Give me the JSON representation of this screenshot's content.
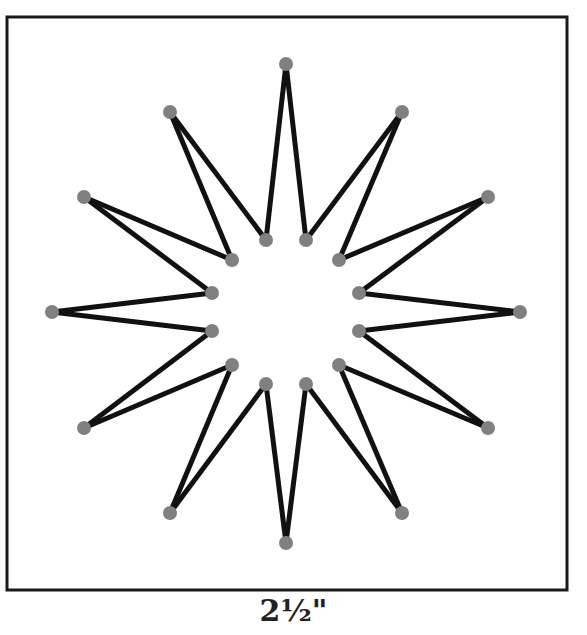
{
  "figure": {
    "caption": "2½\"",
    "frame": {
      "x": 7,
      "y": 17,
      "width": 560,
      "height": 573,
      "stroke": "#1a1a1a"
    },
    "line_color": "#111111",
    "dot_color": "#808080",
    "outer_points": [
      [
        286,
        64
      ],
      [
        402,
        112
      ],
      [
        488,
        197
      ],
      [
        520,
        312
      ],
      [
        488,
        428
      ],
      [
        402,
        513
      ],
      [
        286,
        543
      ],
      [
        170,
        513
      ],
      [
        84,
        428
      ],
      [
        52,
        312
      ],
      [
        84,
        197
      ],
      [
        170,
        112
      ]
    ],
    "inner_points": [
      [
        306,
        240
      ],
      [
        339,
        260
      ],
      [
        359,
        293
      ],
      [
        359,
        331
      ],
      [
        339,
        365
      ],
      [
        306,
        384
      ],
      [
        266,
        384
      ],
      [
        232,
        365
      ],
      [
        212,
        331
      ],
      [
        212,
        293
      ],
      [
        232,
        260
      ],
      [
        266,
        240
      ]
    ]
  }
}
